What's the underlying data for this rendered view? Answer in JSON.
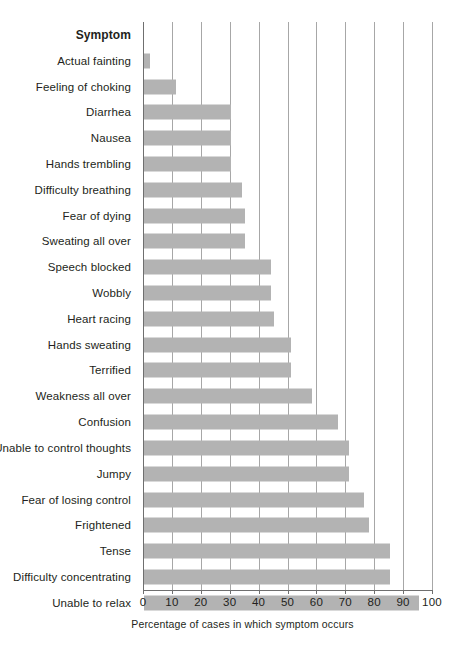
{
  "chart_data": {
    "type": "bar",
    "orientation": "horizontal",
    "title": "",
    "xlabel": "Percentage of cases in which symptom occurs",
    "ylabel": "Symptom",
    "xlim": [
      0,
      100
    ],
    "xticks": [
      0,
      10,
      20,
      30,
      40,
      50,
      60,
      70,
      80,
      90,
      100
    ],
    "grid": true,
    "legend": null,
    "bar_color": "#b3b3b3",
    "categories": [
      "Actual fainting",
      "Feeling of choking",
      "Diarrhea",
      "Nausea",
      "Hands trembling",
      "Difficulty breathing",
      "Fear of dying",
      "Sweating all over",
      "Speech blocked",
      "Wobbly",
      "Heart racing",
      "Hands sweating",
      "Terrified",
      "Weakness all over",
      "Confusion",
      "Unable to control thoughts",
      "Jumpy",
      "Fear of losing control",
      "Frightened",
      "Tense",
      "Difficulty concentrating",
      "Unable to relax"
    ],
    "values": [
      2,
      11,
      30,
      30,
      30,
      34,
      35,
      35,
      44,
      44,
      45,
      51,
      51,
      58,
      67,
      71,
      71,
      76,
      78,
      85,
      85,
      95
    ]
  },
  "axis": {
    "category_header": "Symptom",
    "x_title": "Percentage of cases in which symptom occurs",
    "tick_labels": [
      "0",
      "10",
      "20",
      "30",
      "40",
      "50",
      "60",
      "70",
      "80",
      "90",
      "100"
    ]
  }
}
